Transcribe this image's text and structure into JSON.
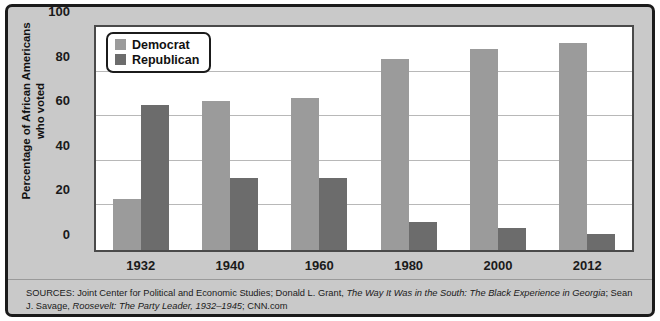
{
  "chart_data": {
    "type": "bar",
    "title": "",
    "xlabel": "",
    "ylabel": "Percentage of African Americans who voted",
    "ylabel_line1": "Percentage of African Americans",
    "ylabel_line2": "who voted",
    "ylim": [
      0,
      100
    ],
    "yticks": [
      0,
      20,
      40,
      60,
      80,
      100
    ],
    "ytick_labels": [
      "0",
      "20",
      "40",
      "60",
      "80",
      "100"
    ],
    "grid": true,
    "legend_position": "upper-left-inside",
    "categories": [
      "1932",
      "1940",
      "1960",
      "1980",
      "2000",
      "2012"
    ],
    "series": [
      {
        "name": "Democrat",
        "color": "#9b9b9b",
        "values": [
          23,
          67,
          68,
          85.5,
          90,
          93
        ]
      },
      {
        "name": "Republican",
        "color": "#6c6c6c",
        "values": [
          65,
          32.5,
          32.5,
          12.5,
          10,
          7
        ]
      }
    ]
  },
  "legend": {
    "items": [
      {
        "label": "Democrat",
        "swatch": "#9b9b9b"
      },
      {
        "label": "Republican",
        "swatch": "#6c6c6c"
      }
    ]
  },
  "sources": {
    "prefix": "SOURCES:",
    "part1": " Joint Center for Political and Economic Studies; Donald L. Grant, ",
    "italic1": "The Way It Was in the South: The Black Experience in Georgia",
    "part2": "; Sean J. Savage, ",
    "italic2": "Roosevelt: The Party Leader, 1932–1945",
    "part3": "; CNN.com"
  },
  "colors": {
    "democrat": "#9b9b9b",
    "republican": "#6c6c6c",
    "background": "#c9c9c9",
    "plot_background": "#ffffff",
    "frame": "#1b1b1b",
    "gridline": "#b8b8b8"
  }
}
